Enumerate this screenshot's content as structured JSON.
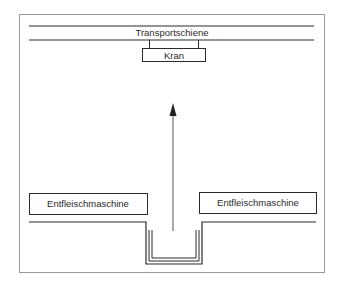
{
  "diagram": {
    "rail_label": "Transportschiene",
    "crane_label": "Kran",
    "machine_left_label": "Entfleischmaschine",
    "machine_right_label": "Entfleischmaschine",
    "arrow_direction": "up",
    "colors": {
      "line": "#2b2b2b",
      "frame": "#9a9a9a",
      "background": "#ffffff"
    }
  }
}
